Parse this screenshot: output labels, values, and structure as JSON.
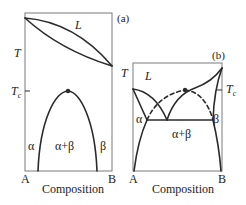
{
  "panels": [
    {
      "id": "a",
      "tag": "(a)",
      "y_label": "T",
      "tc_label_main": "T",
      "tc_label_sub": "c",
      "liquid_label": "L",
      "phase_left": "α",
      "phase_mid": "α+β",
      "phase_right": "β",
      "x_left": "A",
      "x_right": "B",
      "x_label": "Composition"
    },
    {
      "id": "b",
      "tag": "(b)",
      "y_label": "T",
      "tc_label_main": "T",
      "tc_label_sub": "c",
      "liquid_label": "L",
      "phase_left": "α",
      "phase_mid": "α+β",
      "phase_right": "β",
      "x_left": "A",
      "x_right": "B",
      "x_label": "Composition"
    }
  ],
  "colors": {
    "line": "#2a2a2a",
    "frame": "#7a7a7a"
  }
}
